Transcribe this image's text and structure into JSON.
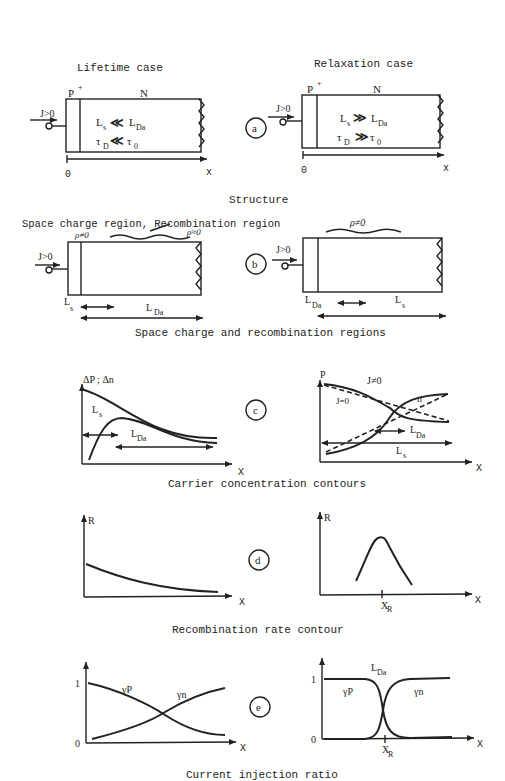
{
  "panels": {
    "a": {
      "badge": "a",
      "caption": "Structure",
      "left": {
        "title": "Lifetime case",
        "p_label": "P",
        "p_sup": "+",
        "n_label": "N",
        "j_label": "J>0",
        "ls": "L",
        "ls_sub": "s",
        "rel1": "≪",
        "lda": "L",
        "lda_sub": "Da",
        "tau_d": "τ",
        "tau_d_sub": "D",
        "rel2": "≪",
        "tau_0": "τ",
        "tau_0_sub": "0",
        "origin": "0",
        "x_axis": "x"
      },
      "right": {
        "title": "Relaxation case",
        "p_label": "P",
        "p_sup": "+",
        "n_label": "N",
        "j_label": "J>0",
        "ls": "L",
        "ls_sub": "s",
        "rel1": "≫",
        "lda": "L",
        "lda_sub": "Da",
        "tau_d": "τ",
        "tau_d_sub": "D",
        "rel2": "≫",
        "tau_0": "τ",
        "tau_0_sub": "0",
        "origin": "0",
        "x_axis": "x"
      }
    },
    "b": {
      "badge": "b",
      "caption": "Space charge and recombination regions",
      "left": {
        "header": "Space charge region, Recombination region",
        "rho_nonzero": "ρ≠0",
        "rho_approx": "ρ≈0",
        "j_label": "J>0",
        "ls": "L",
        "ls_sub": "s",
        "lda": "L",
        "lda_sub": "Da"
      },
      "right": {
        "rho_nonzero": "ρ≠0",
        "j_label": "J>0",
        "lda": "L",
        "lda_sub": "Da",
        "ls": "L",
        "ls_sub": "s"
      }
    },
    "c": {
      "badge": "c",
      "caption": "Carrier concentration contours",
      "left": {
        "y_label": "ΔP ; Δn",
        "ls": "L",
        "ls_sub": "s",
        "lda": "L",
        "lda_sub": "Da",
        "x_axis": "X"
      },
      "right": {
        "p_label": "P",
        "n_label": "n",
        "j_nonzero": "J≠0",
        "j_zero": "J=0",
        "lda": "L",
        "lda_sub": "Da",
        "ls": "L",
        "ls_sub": "s",
        "x_axis": "X"
      }
    },
    "d": {
      "badge": "d",
      "caption": "Recombination rate contour",
      "left": {
        "y_label": "R",
        "x_axis": "X"
      },
      "right": {
        "y_label": "R",
        "x_axis": "X",
        "xr": "X",
        "xr_sub": "R"
      }
    },
    "e": {
      "badge": "e",
      "caption": "Current injection ratio",
      "left": {
        "tick_1": "1",
        "tick_0": "0",
        "gp": "γP",
        "gn": "γn",
        "x_axis": "X"
      },
      "right": {
        "tick_1": "1",
        "tick_0": "0",
        "gp": "γP",
        "gn": "γn",
        "lda": "L",
        "lda_sub": "Da",
        "x_axis": "X",
        "xr": "X",
        "xr_sub": "R"
      }
    }
  }
}
